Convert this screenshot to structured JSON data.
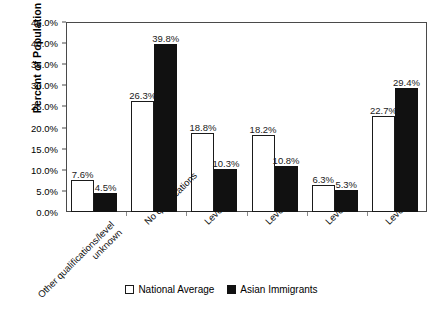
{
  "chart_data": {
    "type": "bar",
    "title": "",
    "subtitle": "",
    "xlabel": "",
    "ylabel": "Percent of Population",
    "ylim": [
      0,
      45
    ],
    "ytick_step": 5,
    "ytick_labels": [
      "0.0%",
      "5.0%",
      "10.0%",
      "15.0%",
      "20.0%",
      "25.0%",
      "30.0%",
      "35.0%",
      "40.0%",
      "45.0%"
    ],
    "ytick_values": [
      0,
      5,
      10,
      15,
      20,
      25,
      30,
      35,
      40,
      45
    ],
    "grid": false,
    "legend_position": "bottom-center",
    "categories": [
      "Other qualifications/level unknown",
      "No qualifications",
      "Level 1",
      "Level 2",
      "Level 3",
      "Level 4/5"
    ],
    "category_lines": [
      [
        "Other qualifications/level",
        "unknown"
      ],
      [
        "No qualifications"
      ],
      [
        "Level 1"
      ],
      [
        "Level 2"
      ],
      [
        "Level 3"
      ],
      [
        "Level 4/5"
      ]
    ],
    "series": [
      {
        "name": "National Average",
        "color": "#ffffff",
        "edge_color": "#1a1a1a",
        "values": [
          7.6,
          26.3,
          18.8,
          18.2,
          6.3,
          22.7
        ],
        "data_labels": [
          "7.6%",
          "26.3%",
          "18.8%",
          "18.2%",
          "6.3%",
          "22.7%"
        ]
      },
      {
        "name": "Asian Immigrants",
        "color": "#111111",
        "edge_color": "#111111",
        "values": [
          4.5,
          39.8,
          10.3,
          10.8,
          5.3,
          29.4
        ],
        "data_labels": [
          "4.5%",
          "39.8%",
          "10.3%",
          "10.8%",
          "5.3%",
          "29.4%"
        ]
      }
    ]
  },
  "legend": {
    "items": [
      {
        "label": "National Average",
        "swatch": "open-square-marker"
      },
      {
        "label": "Asian Immigrants",
        "swatch": "filled-square-marker"
      }
    ]
  }
}
